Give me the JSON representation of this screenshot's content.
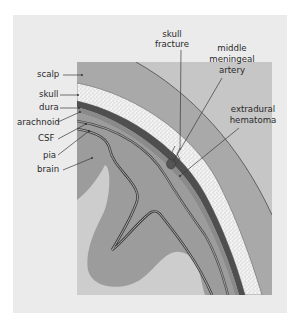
{
  "diagram": {
    "type": "anatomical cross-section",
    "colors": {
      "panel_background": "#ebebeb",
      "scalp": "#a9a9a9",
      "outside_scalp": "#c4c4c4",
      "skull": "#f4f4f4",
      "skull_stipple": "#8a8a8a",
      "dura_band": "#5a5a5a",
      "csf_space": "#b8b8b8",
      "brain": "#9b9b9b",
      "brain_light": "#c9c9c9",
      "hematoma": "#555555",
      "text": "#2a2a2a"
    },
    "left_labels": [
      {
        "id": "scalp",
        "text": "scalp"
      },
      {
        "id": "skull",
        "text": "skull"
      },
      {
        "id": "dura",
        "text": "dura"
      },
      {
        "id": "arachnoid",
        "text": "arachnoid"
      },
      {
        "id": "csf",
        "text": "CSF"
      },
      {
        "id": "pia",
        "text": "pia"
      },
      {
        "id": "brain",
        "text": "brain"
      }
    ],
    "right_labels": [
      {
        "id": "skull-fracture",
        "lines": [
          "skull",
          "fracture"
        ]
      },
      {
        "id": "middle-meningeal-artery",
        "lines": [
          "middle",
          "meningeal",
          "artery"
        ]
      },
      {
        "id": "extradural-hematoma",
        "lines": [
          "extradural",
          "hematoma"
        ]
      }
    ]
  }
}
